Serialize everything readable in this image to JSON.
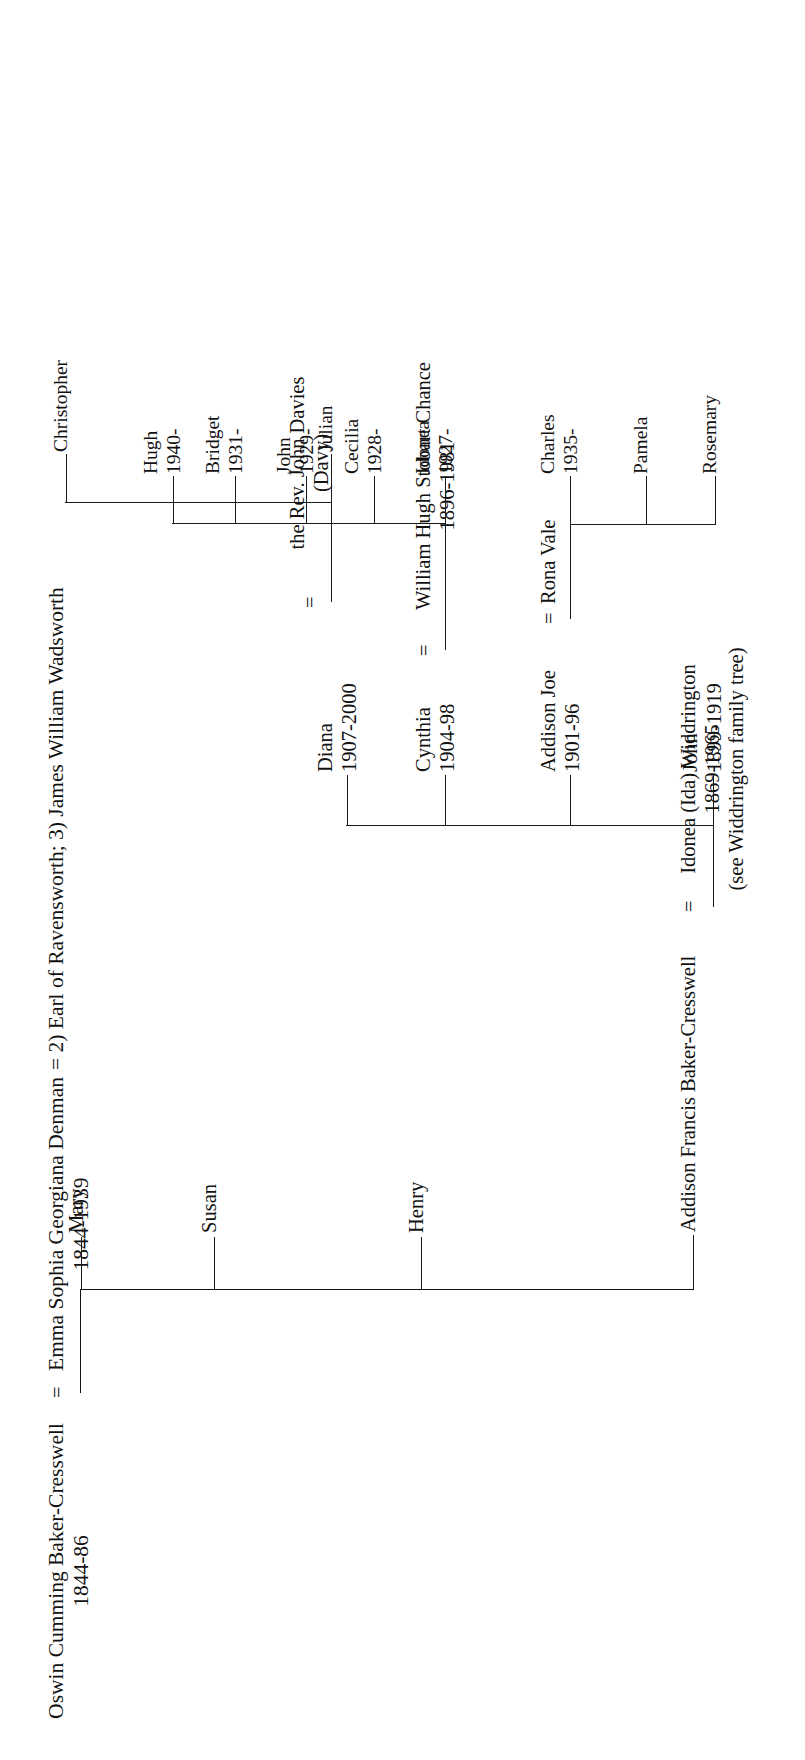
{
  "document": {
    "type": "genealogical-chart",
    "title": "Baker-Cresswell family tree",
    "orientation": "text rotated 90 degrees counter-clockwise (reads bottom-to-top)",
    "background_color": "#ffffff",
    "ink_color": "#121212"
  },
  "generation1": {
    "father": {
      "name": "Oswin Cumming Baker-Cresswell",
      "dates": "1844-86"
    },
    "marriage_symbol": "=",
    "mother": {
      "name": "Emma Sophia Georgiana Denman",
      "dates": "1844-1939",
      "remarriages": "= 2) Earl of Ravensworth; 3) James William Wadsworth"
    }
  },
  "generation2": {
    "children": [
      {
        "name": "Addison Francis Baker-Cresswell",
        "marriage_symbol": "=",
        "spouse_name": "Idonea (Ida) Widdrington",
        "spouse_dates": "1869-1965",
        "spouse_note": "(see Widdrington family tree)"
      },
      {
        "name": "Henry"
      },
      {
        "name": "Susan"
      },
      {
        "name": "Mary"
      }
    ]
  },
  "generation3": {
    "children": [
      {
        "name": "John",
        "dates": "1899-1919"
      },
      {
        "name": "Addison Joe",
        "dates": "1901-96",
        "marriage_symbol": "=",
        "spouse_name": "Rona Vale"
      },
      {
        "name": "Cynthia",
        "dates": "1904-98",
        "marriage_symbol": "=",
        "spouse_name": "William Hugh Stobart Chance",
        "spouse_dates": "1896-1981"
      },
      {
        "name": "Diana",
        "dates": "1907-2000",
        "marriage_symbol": "=",
        "spouse_name": "the Rev. John Davies",
        "spouse_note": "(Davy)"
      }
    ]
  },
  "generation4": {
    "addison_joe_children": [
      {
        "name": "Rosemary",
        "dates": ""
      },
      {
        "name": "Pamela",
        "dates": ""
      },
      {
        "name": "Charles",
        "dates": "1935-"
      }
    ],
    "cynthia_children": [
      {
        "name": "Idonea",
        "dates": "1927-"
      },
      {
        "name": "Cecilia",
        "dates": "1928-"
      },
      {
        "name": "John",
        "dates": "1929-"
      },
      {
        "name": "Bridget",
        "dates": "1931-"
      },
      {
        "name": "Hugh",
        "dates": "1940-"
      }
    ],
    "diana_children": [
      {
        "name": "Julian",
        "dates": ""
      },
      {
        "name": "Christopher",
        "dates": ""
      }
    ]
  }
}
